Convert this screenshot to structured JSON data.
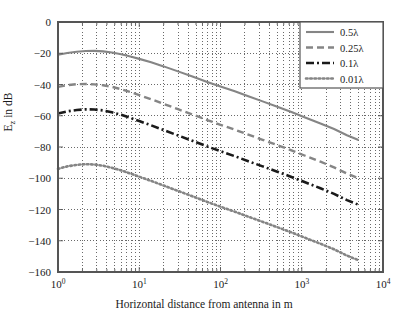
{
  "chart_data": {
    "type": "line",
    "title": "",
    "xlabel": "Horizontal distance from antenna in m",
    "ylabel": "E_z in dB",
    "xscale": "log",
    "yscale": "linear",
    "xlim": [
      1,
      10000
    ],
    "ylim": [
      -160,
      0
    ],
    "xticks": [
      1,
      10,
      100,
      1000,
      10000
    ],
    "xtick_labels": [
      "10^0",
      "10^1",
      "10^2",
      "10^3",
      "10^4"
    ],
    "yticks": [
      0,
      -20,
      -40,
      -60,
      -80,
      -100,
      -120,
      -140,
      -160
    ],
    "ytick_labels": [
      "0",
      "-20",
      "-40",
      "-60",
      "-80",
      "-100",
      "-120",
      "-140",
      "-160"
    ],
    "grid": "both-minor-dotted",
    "legend_position": "upper-right",
    "series": [
      {
        "name": "0.5λ",
        "style": "solid",
        "color": "#858585",
        "x": [
          1,
          1.3,
          1.7,
          2.2,
          2.8,
          3.6,
          4.6,
          6,
          8,
          10,
          14,
          20,
          30,
          46,
          70,
          100,
          150,
          220,
          330,
          500,
          760,
          1100,
          1700,
          2500,
          3600,
          5000
        ],
        "y": [
          -21.0,
          -19.8,
          -19.0,
          -18.6,
          -18.5,
          -18.8,
          -19.5,
          -20.6,
          -22.2,
          -23.6,
          -25.8,
          -28.4,
          -31.6,
          -35.0,
          -38.5,
          -41.3,
          -44.3,
          -47.5,
          -50.8,
          -54.2,
          -57.8,
          -61.1,
          -64.9,
          -68.5,
          -72.5,
          -75.5
        ]
      },
      {
        "name": "0.25λ",
        "style": "dashed",
        "color": "#858585",
        "x": [
          1,
          1.3,
          1.7,
          2.2,
          2.8,
          3.6,
          4.6,
          6,
          8,
          10,
          14,
          20,
          30,
          46,
          70,
          100,
          150,
          220,
          330,
          500,
          760,
          1100,
          1700,
          2500,
          3600,
          5000
        ],
        "y": [
          -41.5,
          -40.4,
          -39.8,
          -39.7,
          -39.9,
          -40.5,
          -41.5,
          -43.0,
          -45.0,
          -46.8,
          -49.4,
          -52.4,
          -55.8,
          -59.3,
          -62.9,
          -65.8,
          -68.9,
          -72.1,
          -75.4,
          -78.8,
          -82.3,
          -85.6,
          -89.4,
          -93.0,
          -97.0,
          -100.0
        ]
      },
      {
        "name": "0.1λ",
        "style": "dashdot",
        "color": "#1a1a1a",
        "x": [
          1,
          1.3,
          1.7,
          2.2,
          2.8,
          3.6,
          4.6,
          6,
          8,
          10,
          14,
          20,
          30,
          46,
          70,
          100,
          150,
          220,
          330,
          500,
          760,
          1100,
          1700,
          2500,
          3600,
          5000
        ],
        "y": [
          -58.5,
          -57.2,
          -56.3,
          -55.9,
          -56.0,
          -56.6,
          -57.8,
          -59.4,
          -61.6,
          -63.4,
          -66.1,
          -69.2,
          -72.6,
          -76.2,
          -79.8,
          -82.7,
          -85.9,
          -89.1,
          -92.4,
          -95.8,
          -99.3,
          -102.6,
          -106.4,
          -110.0,
          -114.0,
          -117.0
        ]
      },
      {
        "name": "0.01λ",
        "style": "dotted",
        "color": "#858585",
        "x": [
          1,
          1.3,
          1.7,
          2.2,
          2.8,
          3.6,
          4.6,
          6,
          8,
          10,
          14,
          20,
          30,
          46,
          70,
          100,
          150,
          220,
          330,
          500,
          760,
          1100,
          1700,
          2500,
          3600,
          5000
        ],
        "y": [
          -94.0,
          -92.4,
          -91.4,
          -91.0,
          -91.2,
          -92.0,
          -93.3,
          -95.0,
          -97.2,
          -99.0,
          -101.7,
          -104.7,
          -108.1,
          -111.7,
          -115.3,
          -118.2,
          -121.4,
          -124.6,
          -127.9,
          -131.3,
          -134.8,
          -138.1,
          -141.9,
          -145.5,
          -149.5,
          -152.5
        ]
      }
    ]
  },
  "legend": {
    "entries": [
      {
        "label": "0.5λ"
      },
      {
        "label": "0.25λ"
      },
      {
        "label": "0.1λ"
      },
      {
        "label": "0.01λ"
      }
    ]
  },
  "axes": {
    "ylabel_main": "E",
    "ylabel_sub": "z",
    "ylabel_tail": " in dB",
    "xlabel": "Horizontal distance from antenna in m"
  },
  "colors": {
    "gray_series": "#858585",
    "black_series": "#1a1a1a",
    "grid": "#444444",
    "axis": "#555555",
    "background": "#ffffff"
  }
}
